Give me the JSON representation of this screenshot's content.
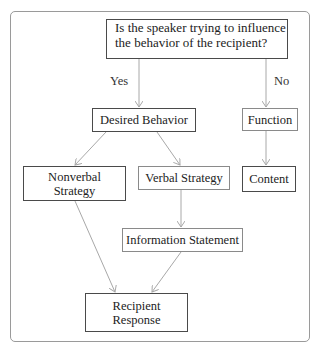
{
  "diagram": {
    "question": "Is the speaker trying to influence\nthe behavior of the recipient?",
    "question_line1": "Is the speaker trying to influence",
    "question_line2": "the behavior of the recipient?",
    "branch_yes": "Yes",
    "branch_no": "No",
    "nodes": {
      "desired_behavior": "Desired Behavior",
      "function": "Function",
      "content": "Content",
      "nonverbal_line1": "Nonverbal",
      "nonverbal_line2": "Strategy",
      "verbal_strategy": "Verbal Strategy",
      "information_statement": "Information Statement",
      "recipient_line1": "Recipient",
      "recipient_line2": "Response"
    },
    "edges": [
      {
        "from": "question",
        "to": "desired_behavior",
        "label": "Yes"
      },
      {
        "from": "question",
        "to": "function",
        "label": "No"
      },
      {
        "from": "desired_behavior",
        "to": "nonverbal_strategy"
      },
      {
        "from": "desired_behavior",
        "to": "verbal_strategy"
      },
      {
        "from": "function",
        "to": "content"
      },
      {
        "from": "verbal_strategy",
        "to": "information_statement"
      },
      {
        "from": "nonverbal_strategy",
        "to": "recipient_response"
      },
      {
        "from": "information_statement",
        "to": "recipient_response"
      }
    ],
    "colors": {
      "box_border_dark": "#4a4a4a",
      "box_border_light": "#8a8a8a",
      "arrow": "#a8a8a8",
      "frame": "#9a9a9a"
    }
  }
}
